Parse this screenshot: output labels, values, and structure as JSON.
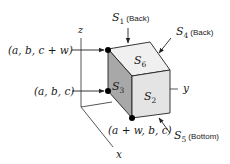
{
  "diagram": {
    "type": "3d-cube-with-axes",
    "colors": {
      "face_top": "#f0f0f0",
      "face_front": "#e4e4e4",
      "face_left": "#a8a8a8",
      "stroke": "#222222",
      "vertex": "#000000"
    },
    "axes": {
      "x_label": "x",
      "y_label": "y",
      "z_label": "z"
    },
    "faces": {
      "top": {
        "symbol": "S",
        "sub": "6"
      },
      "left": {
        "symbol": "S",
        "sub": "3"
      },
      "front": {
        "symbol": "S",
        "sub": "2"
      }
    },
    "callouts": [
      {
        "id": "s1",
        "symbol": "S",
        "sub": "1",
        "note": "(Back)"
      },
      {
        "id": "s4",
        "symbol": "S",
        "sub": "4",
        "note": "(Back)"
      },
      {
        "id": "s5",
        "symbol": "S",
        "sub": "5",
        "note": "(Bottom)"
      }
    ],
    "vertex_labels": {
      "top_left": "(a, b, c + w)",
      "bottom_left": "(a, b, c)",
      "front_bottom": "(a + w, b, c)"
    }
  }
}
